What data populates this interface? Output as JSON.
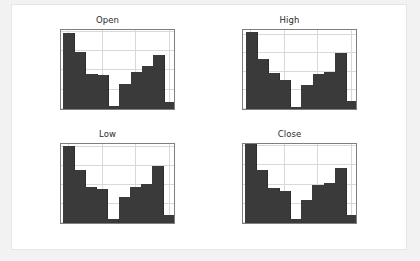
{
  "figure": {
    "background": "#ffffff",
    "page_background": "#f2f2f2",
    "bar_color": "#3a3a3a",
    "grid_color": "#d9d9d9",
    "axis_color": "#7f7f7f"
  },
  "chart_data": [
    {
      "type": "bar",
      "title": "Open",
      "xlabel": "",
      "ylabel": "",
      "grid": true,
      "legend": "none",
      "xlim": [
        78,
        422
      ],
      "ylim": [
        0,
        210
      ],
      "xticks": [
        100,
        200,
        300,
        400
      ],
      "yticks": [
        0,
        50,
        100,
        150,
        200
      ],
      "bin_edges": [
        84,
        117,
        151,
        185,
        218,
        252,
        286,
        319,
        353,
        387,
        420
      ],
      "values": [
        198,
        147,
        91,
        87,
        7,
        66,
        95,
        111,
        141,
        18
      ]
    },
    {
      "type": "bar",
      "title": "High",
      "xlabel": "",
      "ylabel": "",
      "grid": true,
      "legend": "none",
      "xlim": [
        78,
        422
      ],
      "ylim": [
        0,
        218
      ],
      "xticks": [
        100,
        200,
        300,
        400
      ],
      "yticks": [
        0,
        50,
        100,
        150,
        200
      ],
      "bin_edges": [
        86,
        119,
        152,
        186,
        219,
        252,
        286,
        319,
        352,
        386,
        419
      ],
      "values": [
        208,
        135,
        97,
        79,
        6,
        64,
        95,
        100,
        151,
        22
      ]
    },
    {
      "type": "bar",
      "title": "Low",
      "xlabel": "",
      "ylabel": "",
      "grid": true,
      "legend": "none",
      "xlim": [
        78,
        422
      ],
      "ylim": [
        0,
        212
      ],
      "xticks": [
        100,
        200,
        300,
        400
      ],
      "yticks": [
        0,
        50,
        100,
        150,
        200
      ],
      "bin_edges": [
        83,
        116,
        150,
        183,
        217,
        250,
        284,
        317,
        351,
        384,
        418
      ],
      "values": [
        202,
        139,
        93,
        88,
        11,
        68,
        93,
        102,
        148,
        21
      ]
    },
    {
      "type": "bar",
      "title": "Close",
      "xlabel": "",
      "ylabel": "",
      "grid": true,
      "legend": "none",
      "xlim": [
        78,
        422
      ],
      "ylim": [
        0,
        211
      ],
      "xticks": [
        100,
        200,
        300,
        400
      ],
      "yticks": [
        0,
        50,
        100,
        150,
        200
      ],
      "bin_edges": [
        84,
        117,
        151,
        185,
        218,
        252,
        285,
        319,
        352,
        386,
        420
      ],
      "values": [
        206,
        138,
        92,
        83,
        10,
        61,
        99,
        105,
        143,
        20
      ]
    }
  ]
}
